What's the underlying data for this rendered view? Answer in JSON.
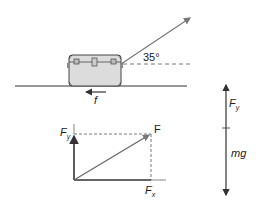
{
  "diagram": {
    "scene": {
      "angle_label": "35°",
      "friction_label": "f",
      "applied_force": "pull-at-angle",
      "object": "suitcase"
    },
    "component_diagram": {
      "resultant_label": "F",
      "x_component_label": "F",
      "x_component_sub": "x",
      "y_component_label": "F",
      "y_component_sub": "y"
    },
    "vertical_forces": {
      "up_label": "F",
      "up_sub": "y",
      "down_label": "mg"
    },
    "colors": {
      "line": "#333333",
      "pull_arrow": "#777777",
      "suitcase_fill": "#dcdcdc",
      "suitcase_stroke": "#444444"
    }
  }
}
